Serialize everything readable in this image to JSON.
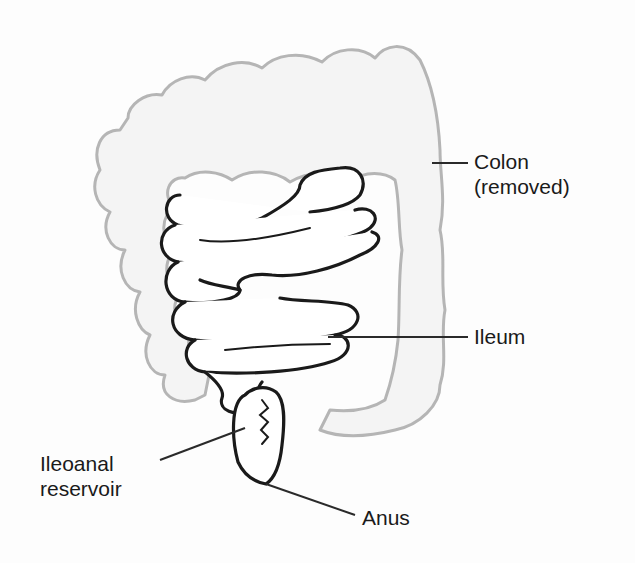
{
  "diagram": {
    "type": "anatomical-illustration",
    "labels": {
      "colon_line1": "Colon",
      "colon_line2": "(removed)",
      "ileum": "Ileum",
      "reservoir_line1": "Ileoanal",
      "reservoir_line2": "reservoir",
      "anus": "Anus"
    },
    "colors": {
      "background": "#fdfdfd",
      "colon_outline": "#b5b5b5",
      "ileum_outline": "#1a1a1a",
      "leader_line": "#2a2a2a",
      "text": "#1a1a1a"
    }
  }
}
